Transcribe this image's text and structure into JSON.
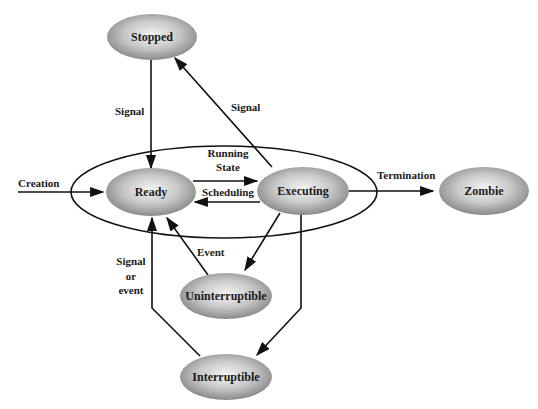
{
  "diagram": {
    "nodes": {
      "stopped": "Stopped",
      "ready": "Ready",
      "executing": "Executing",
      "zombie": "Zombie",
      "uninterruptible": "Uninterruptible",
      "interruptible": "Interruptible"
    },
    "group": {
      "running_state_line1": "Running",
      "running_state_line2": "State"
    },
    "edges": {
      "creation": "Creation",
      "stopped_to_ready": "Signal",
      "executing_to_stopped": "Signal",
      "scheduling": "Scheduling",
      "termination": "Termination",
      "event": "Event",
      "signal_or_event_1": "Signal",
      "signal_or_event_2": "or",
      "signal_or_event_3": "event"
    },
    "colors": {
      "node_fill_center": "#f2f2f2",
      "node_fill_edge": "#8c8c8c",
      "line": "#111111"
    }
  }
}
